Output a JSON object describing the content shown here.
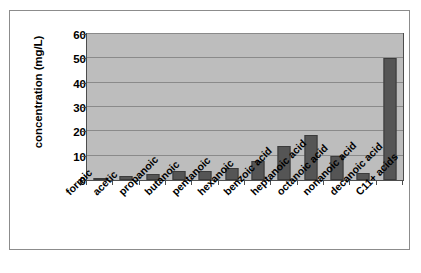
{
  "chart_data": {
    "type": "bar",
    "title": "",
    "xlabel": "",
    "ylabel": "concentration (mg/L)",
    "ylim": [
      0,
      60
    ],
    "yticks": [
      0,
      10,
      20,
      30,
      40,
      50,
      60
    ],
    "ytick_labels": [
      "0",
      "10",
      "20",
      "30",
      "40",
      "50",
      "60"
    ],
    "grid": true,
    "legend": false,
    "legend_position": "none",
    "bar_color": "#555555",
    "plot_background": "#bdbdbd",
    "categories": [
      "formic",
      "acetic",
      "propanoic",
      "butanoic",
      "pentanoic",
      "hexanoic",
      "benzoic acid",
      "heptanoic acid",
      "octanoic acid",
      "nonanoic acid",
      "decanoic acid",
      "C11+ acids"
    ],
    "values": [
      0.5,
      1.5,
      2.5,
      3.5,
      3.5,
      4.8,
      8.0,
      14.0,
      18.3,
      10.0,
      3.0,
      50.0
    ]
  }
}
